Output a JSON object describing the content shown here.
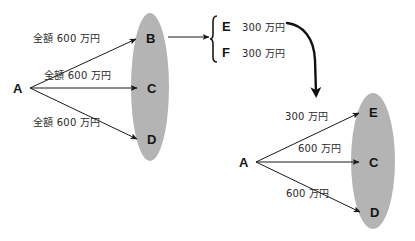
{
  "diagram": {
    "colors": {
      "ellipse_fill": "#b4b4b4",
      "line": "#1a1a1a",
      "text": "#141414",
      "background": "#ffffff"
    },
    "left_group": {
      "source": {
        "id": "A-left",
        "label": "A"
      },
      "targets": [
        {
          "id": "B",
          "label": "B"
        },
        {
          "id": "C",
          "label": "C"
        },
        {
          "id": "D",
          "label": "D"
        }
      ],
      "edge_labels": [
        {
          "id": "edge-a-b",
          "text": "全額 600 万円"
        },
        {
          "id": "edge-a-c",
          "text": "全額 600 万円"
        },
        {
          "id": "edge-a-d",
          "text": "全額 600 万円"
        }
      ]
    },
    "split_box": {
      "rows": [
        {
          "label": "E",
          "amount": "300 万円"
        },
        {
          "label": "F",
          "amount": "300 万円"
        }
      ]
    },
    "right_group": {
      "source": {
        "id": "A-right",
        "label": "A"
      },
      "targets": [
        {
          "id": "E",
          "label": "E"
        },
        {
          "id": "C",
          "label": "C"
        },
        {
          "id": "D",
          "label": "D"
        }
      ],
      "edge_labels": [
        {
          "id": "edge-a-e",
          "text": "300 万円"
        },
        {
          "id": "edge-a-c2",
          "text": "600 万円"
        },
        {
          "id": "edge-a-d2",
          "text": "600 万円"
        }
      ]
    }
  }
}
